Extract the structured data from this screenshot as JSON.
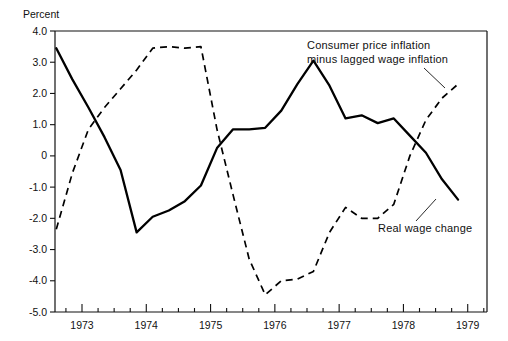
{
  "chart_data": {
    "type": "line",
    "title": "",
    "subtitle": "",
    "xlabel": "",
    "ylabel": "Percent",
    "ylabel_position": "above-axis",
    "xlim": [
      1972.58,
      1979.3
    ],
    "ylim": [
      -5.0,
      4.0
    ],
    "grid": false,
    "legend": "inline-annotations",
    "y_ticks": [
      "4.0",
      "3.0",
      "2.0",
      "1.0",
      "0",
      "-1.0",
      "-2.0",
      "-3.0",
      "-4.0",
      "-5.0"
    ],
    "y_tick_values": [
      4.0,
      3.0,
      2.0,
      1.0,
      0,
      -1.0,
      -2.0,
      -3.0,
      -4.0,
      -5.0
    ],
    "x_ticks": [
      "1973",
      "1974",
      "1975",
      "1976",
      "1977",
      "1978",
      "1979"
    ],
    "x_tick_values": [
      1973,
      1974,
      1975,
      1976,
      1977,
      1978,
      1979
    ],
    "x_minor_ticks_per_year": 4,
    "series": [
      {
        "name": "Consumer price inflation minus lagged wage inflation",
        "style": "solid",
        "color": "#000000",
        "x": [
          1972.6,
          1972.85,
          1973.1,
          1973.35,
          1973.6,
          1973.85,
          1974.1,
          1974.35,
          1974.6,
          1974.85,
          1975.1,
          1975.35,
          1975.6,
          1975.85,
          1976.1,
          1976.35,
          1976.6,
          1976.85,
          1977.1,
          1977.35,
          1977.6,
          1977.85,
          1978.1,
          1978.35,
          1978.6,
          1978.85
        ],
        "values": [
          3.45,
          2.45,
          1.55,
          0.6,
          -0.45,
          -2.45,
          -1.95,
          -1.75,
          -1.45,
          -0.95,
          0.25,
          0.85,
          0.85,
          0.9,
          1.45,
          2.3,
          3.05,
          2.25,
          1.2,
          1.3,
          1.05,
          1.2,
          0.65,
          0.1,
          -0.75,
          -1.4
        ],
        "annotation": {
          "text_line1": "Consumer price inflation",
          "text_line2": "minus lagged wage inflation"
        }
      },
      {
        "name": "Real wage change",
        "style": "dashed",
        "color": "#000000",
        "x": [
          1972.6,
          1972.85,
          1973.1,
          1973.35,
          1973.6,
          1973.85,
          1974.1,
          1974.35,
          1974.6,
          1974.85,
          1975.1,
          1975.35,
          1975.6,
          1975.85,
          1976.1,
          1976.35,
          1976.6,
          1976.85,
          1977.1,
          1977.35,
          1977.6,
          1977.85,
          1978.1,
          1978.35,
          1978.6,
          1978.85
        ],
        "values": [
          -2.35,
          -0.55,
          0.85,
          1.55,
          2.15,
          2.75,
          3.45,
          3.5,
          3.45,
          3.5,
          0.85,
          -1.25,
          -3.3,
          -4.45,
          -4.0,
          -3.95,
          -3.7,
          -2.45,
          -1.65,
          -2.0,
          -2.0,
          -1.55,
          0.0,
          1.15,
          1.85,
          2.3
        ],
        "annotation": {
          "text_line1": "Real wage change"
        }
      }
    ]
  },
  "annotations": {
    "series_solid_label_line1": "Consumer price inflation",
    "series_solid_label_line2": "minus lagged wage inflation",
    "series_dashed_label": "Real wage change"
  },
  "axes": {
    "y_axis_title": "Percent",
    "y_tick_labels": [
      "4.0",
      "3.0",
      "2.0",
      "1.0",
      "0",
      "-1.0",
      "-2.0",
      "-3.0",
      "-4.0",
      "-5.0"
    ],
    "x_tick_labels": [
      "1973",
      "1974",
      "1975",
      "1976",
      "1977",
      "1978",
      "1979"
    ]
  }
}
